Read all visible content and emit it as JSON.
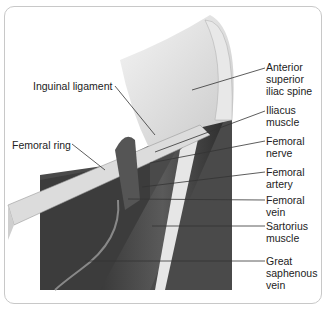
{
  "diagram": {
    "labels": [
      {
        "id": "anterior-superior-iliac-spine",
        "text": "Anterior\nsuperior\niliac spine"
      },
      {
        "id": "inguinal-ligament",
        "text": "Inguinal ligament"
      },
      {
        "id": "iliacus-muscle",
        "text": "Iliacus\nmuscle"
      },
      {
        "id": "femoral-ring",
        "text": "Femoral ring"
      },
      {
        "id": "femoral-nerve",
        "text": "Femoral\nnerve"
      },
      {
        "id": "femoral-artery",
        "text": "Femoral\nartery"
      },
      {
        "id": "femoral-vein",
        "text": "Femoral\nvein"
      },
      {
        "id": "sartorius-muscle",
        "text": "Sartorius\nmuscle"
      },
      {
        "id": "great-saphenous-vein",
        "text": "Great\nsaphenous\nvein"
      }
    ]
  }
}
